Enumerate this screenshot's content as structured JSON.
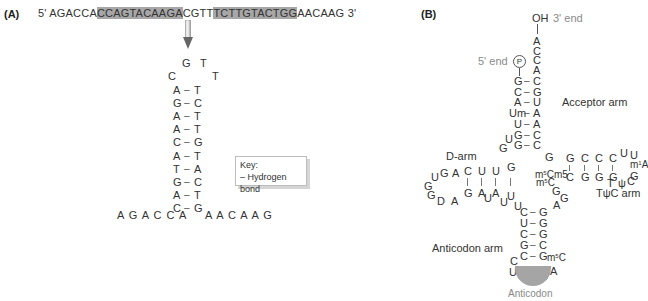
{
  "panelA": {
    "label": "(A)",
    "sequence": {
      "prime5": "5'",
      "prime3": "3'",
      "segments": [
        {
          "text": "AGACCA",
          "highlight": false
        },
        {
          "text": "CCAGTACAAGA",
          "highlight": true
        },
        {
          "text": "CGTT",
          "highlight": false
        },
        {
          "text": "TCTTGTACTGG",
          "highlight": true
        },
        {
          "text": "AACAAG",
          "highlight": false
        }
      ]
    },
    "hairpin": {
      "loop": [
        {
          "base": "G",
          "x": 182,
          "y": 58
        },
        {
          "base": "T",
          "x": 200,
          "y": 58
        },
        {
          "base": "C",
          "x": 168,
          "y": 71
        },
        {
          "base": "T",
          "x": 212,
          "y": 71
        }
      ],
      "pairs": [
        {
          "left": "A",
          "right": "T"
        },
        {
          "left": "G",
          "right": "C"
        },
        {
          "left": "A",
          "right": "T"
        },
        {
          "left": "A",
          "right": "T"
        },
        {
          "left": "C",
          "right": "G"
        },
        {
          "left": "A",
          "right": "T"
        },
        {
          "left": "T",
          "right": "A"
        },
        {
          "left": "G",
          "right": "C"
        },
        {
          "left": "A",
          "right": "T"
        },
        {
          "left": "C",
          "right": "G"
        }
      ],
      "bond_symbol": "–",
      "tail_left": "A G A C C A",
      "tail_right": "A A C A A G"
    },
    "key": {
      "title": "Key:",
      "entry": "– Hydrogen bond"
    }
  },
  "panelB": {
    "label": "(B)",
    "end3_label": "3' end",
    "end5_label": "5' end",
    "oh": "OH",
    "phosphate": "P",
    "acceptor_tail": [
      "A",
      "C",
      "C",
      "A"
    ],
    "acceptor_pairs": [
      {
        "left": "G",
        "right": "C"
      },
      {
        "left": "C",
        "right": "G"
      },
      {
        "left": "A",
        "right": "U"
      },
      {
        "left": "Um",
        "right": "A"
      },
      {
        "left": "U",
        "right": "A"
      },
      {
        "left": "G",
        "right": "C"
      },
      {
        "left": "G",
        "right": "C"
      }
    ],
    "arm_labels": {
      "acceptor": "Acceptor arm",
      "d_arm": "D-arm",
      "tpsic": "TψC arm",
      "anticodon_arm": "Anticodon arm",
      "anticodon": "Anticodon"
    },
    "d_arm": {
      "top": [
        "C",
        "U",
        "U",
        "G"
      ],
      "bottom": [
        "G",
        "A",
        "A",
        "U"
      ],
      "loop": [
        "G",
        "A",
        "G",
        "U",
        "G",
        "G",
        "D",
        "A"
      ],
      "connector": [
        "G",
        "U"
      ]
    },
    "tpsic_arm": {
      "top": [
        "G",
        "C",
        "C",
        "C"
      ],
      "bottom": [
        "C",
        "G",
        "G",
        "G"
      ],
      "loop": [
        "U",
        "U",
        "m1A",
        "G",
        "C",
        "ψ",
        "T"
      ],
      "modified": [
        "m5C",
        "m5C",
        "m5C"
      ]
    },
    "variable": [
      "G",
      "A",
      "G",
      "U"
    ],
    "anticodon_pairs": [
      {
        "left": "C",
        "right": "G"
      },
      {
        "left": "U",
        "right": "G"
      },
      {
        "left": "C",
        "right": "G"
      },
      {
        "left": "G",
        "right": "C"
      },
      {
        "left": "C",
        "right": "G"
      }
    ],
    "anticodon_loop": {
      "left": [
        "C",
        "U"
      ],
      "right": [
        "m5C",
        "A"
      ],
      "codon": [
        "G",
        "C",
        "C"
      ]
    }
  }
}
